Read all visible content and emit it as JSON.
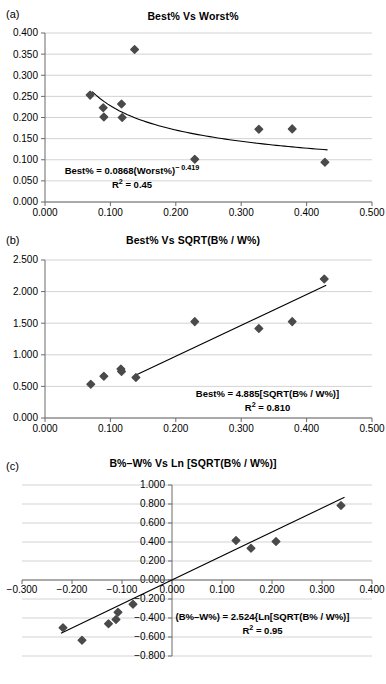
{
  "figure": {
    "panels": [
      "a",
      "b",
      "c"
    ],
    "marker_color": "#4a4a4a",
    "line_color": "#000000",
    "grid_color": "#c8c8c8",
    "axis_color": "#808080"
  },
  "panel_a": {
    "letter": "(a)",
    "title": "Best% Vs Worst%",
    "equation_line1": "Best% = 0.0868(Worst%)",
    "equation_exponent": "− 0.419",
    "equation_line2_pre": "R",
    "equation_line2_sup": "2",
    "equation_line2_post": " = 0.45"
  },
  "panel_b": {
    "letter": "(b)",
    "title": "Best% Vs SQRT(B% / W%)",
    "equation_line1": "Best% = 4.885[SQRT(B% / W%)]",
    "equation_line2_pre": "R",
    "equation_line2_sup": "2",
    "equation_line2_post": " = 0.810"
  },
  "panel_c": {
    "letter": "(c)",
    "title": "B%–W% Vs Ln [SQRT(B% / W%)]",
    "equation_line1": "(B%–W%) = 2.524{Ln[SQRT(B% / W%)]",
    "equation_line2_pre": "R",
    "equation_line2_sup": "2",
    "equation_line2_post": " = 0.95"
  },
  "chart_data": [
    {
      "type": "scatter",
      "panel": "a",
      "title": "Best% Vs Worst%",
      "xlabel": "",
      "ylabel": "",
      "xlim": [
        0.0,
        0.5
      ],
      "ylim": [
        0.0,
        0.4
      ],
      "xticks": [
        0.0,
        0.1,
        0.2,
        0.3,
        0.4,
        0.5
      ],
      "xticklabels": [
        "0.000",
        "0.100",
        "0.200",
        "0.300",
        "0.400",
        "0.500"
      ],
      "yticks": [
        0.0,
        0.05,
        0.1,
        0.15,
        0.2,
        0.25,
        0.3,
        0.35,
        0.4
      ],
      "yticklabels": [
        "0.000",
        "0.050",
        "0.100",
        "0.150",
        "0.200",
        "0.250",
        "0.300",
        "0.350",
        "0.400"
      ],
      "grid": true,
      "legend": "none",
      "points": [
        {
          "x": 0.069,
          "y": 0.253
        },
        {
          "x": 0.089,
          "y": 0.223
        },
        {
          "x": 0.09,
          "y": 0.201
        },
        {
          "x": 0.117,
          "y": 0.232
        },
        {
          "x": 0.118,
          "y": 0.2
        },
        {
          "x": 0.137,
          "y": 0.361
        },
        {
          "x": 0.229,
          "y": 0.101
        },
        {
          "x": 0.327,
          "y": 0.172
        },
        {
          "x": 0.378,
          "y": 0.173
        },
        {
          "x": 0.428,
          "y": 0.094
        }
      ],
      "fit": {
        "kind": "power",
        "coefficient": 0.0868,
        "exponent": -0.419,
        "equation": "Best% = 0.0868(Worst%)^-0.419",
        "r_squared": 0.45,
        "x_range": [
          0.072,
          0.432
        ]
      }
    },
    {
      "type": "scatter",
      "panel": "b",
      "title": "Best% Vs SQRT(B% / W%)",
      "xlabel": "",
      "ylabel": "",
      "xlim": [
        0.0,
        0.5
      ],
      "ylim": [
        0.0,
        2.5
      ],
      "xticks": [
        0.0,
        0.1,
        0.2,
        0.3,
        0.4,
        0.5
      ],
      "xticklabels": [
        "0.000",
        "0.100",
        "0.200",
        "0.300",
        "0.400",
        "0.500"
      ],
      "yticks": [
        0.0,
        0.5,
        1.0,
        1.5,
        2.0,
        2.5
      ],
      "yticklabels": [
        "0.000",
        "0.500",
        "1.000",
        "1.500",
        "2.000",
        "2.500"
      ],
      "grid": true,
      "legend": "none",
      "points": [
        {
          "x": 0.07,
          "y": 0.535
        },
        {
          "x": 0.09,
          "y": 0.66
        },
        {
          "x": 0.116,
          "y": 0.775
        },
        {
          "x": 0.117,
          "y": 0.735
        },
        {
          "x": 0.139,
          "y": 0.64
        },
        {
          "x": 0.229,
          "y": 1.525
        },
        {
          "x": 0.327,
          "y": 1.415
        },
        {
          "x": 0.378,
          "y": 1.525
        },
        {
          "x": 0.427,
          "y": 2.2
        }
      ],
      "fit": {
        "kind": "linear",
        "slope": 4.885,
        "intercept": 0.0,
        "equation": "Best% = 4.885[SQRT(B% / W%)]",
        "r_squared": 0.81,
        "x_range": [
          0.14,
          0.43
        ]
      }
    },
    {
      "type": "scatter",
      "panel": "c",
      "title": "B%–W% Vs Ln [SQRT(B% / W%)]",
      "xlabel": "",
      "ylabel": "",
      "xlim": [
        -0.3,
        0.4
      ],
      "ylim": [
        -0.8,
        1.0
      ],
      "xticks": [
        -0.3,
        -0.2,
        -0.1,
        0.0,
        0.1,
        0.2,
        0.3,
        0.4
      ],
      "xticklabels": [
        "−0.300",
        "−0.200",
        "−0.100",
        "0.000",
        "0.100",
        "0.200",
        "0.300",
        "0.400"
      ],
      "yticks": [
        -0.8,
        -0.6,
        -0.4,
        -0.2,
        0.0,
        0.2,
        0.4,
        0.6,
        0.8,
        1.0
      ],
      "yticklabels": [
        "−0.800",
        "−0.600",
        "−0.400",
        "−0.200",
        "0.000",
        "0.200",
        "0.400",
        "0.600",
        "0.800",
        "1.000"
      ],
      "grid": true,
      "legend": "none",
      "points": [
        {
          "x": -0.218,
          "y": -0.503
        },
        {
          "x": -0.18,
          "y": -0.635
        },
        {
          "x": -0.127,
          "y": -0.46
        },
        {
          "x": -0.112,
          "y": -0.415
        },
        {
          "x": -0.108,
          "y": -0.34
        },
        {
          "x": -0.078,
          "y": -0.255
        },
        {
          "x": 0.128,
          "y": 0.415
        },
        {
          "x": 0.158,
          "y": 0.335
        },
        {
          "x": 0.208,
          "y": 0.405
        },
        {
          "x": 0.338,
          "y": 0.785
        }
      ],
      "fit": {
        "kind": "linear",
        "slope": 2.524,
        "intercept": 0.0,
        "equation": "(B%–W%) = 2.524{Ln[SQRT(B% / W%)]",
        "r_squared": 0.95,
        "x_range": [
          -0.222,
          0.345
        ]
      }
    }
  ]
}
